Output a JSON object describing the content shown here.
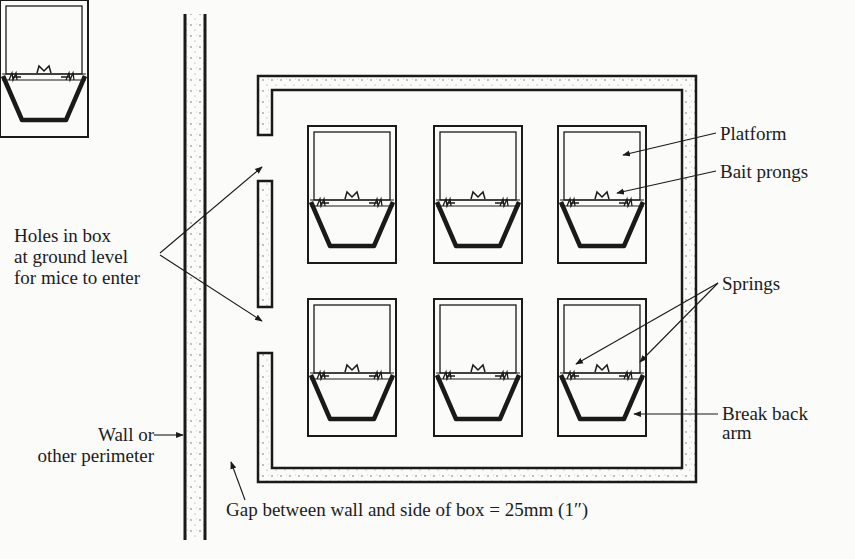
{
  "diagram": {
    "type": "plan view of mouse trap box",
    "labels": {
      "holes": [
        "Holes in box",
        "at ground level",
        "for mice to enter"
      ],
      "wall": [
        "Wall or",
        "other perimeter"
      ],
      "gap": "Gap between wall and side of box = 25mm (1″)",
      "platform": "Platform",
      "bait_prongs": "Bait prongs",
      "springs": "Springs",
      "break_back_arm": [
        "Break back",
        "arm"
      ]
    },
    "traps": {
      "rows": 2,
      "columns": 3,
      "count": 6
    },
    "colors": {
      "ink": "#1a1a1a",
      "paper": "#fbfbf9"
    }
  }
}
